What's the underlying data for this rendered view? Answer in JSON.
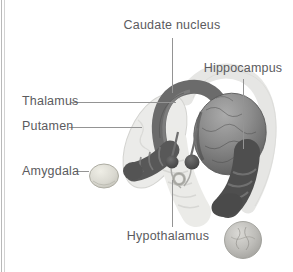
{
  "figure": {
    "type": "brain-anatomy-diagram",
    "labels": {
      "caudate_nucleus": "Caudate nucleus",
      "hippocampus": "Hippocampus",
      "thalamus": "Thalamus",
      "putamen": "Putamen",
      "amygdala": "Amygdala",
      "hypothalamus": "Hypothalamus"
    },
    "colors": {
      "background": "#ffffff",
      "label_text": "#5b5b5e",
      "leader_line": "#949494",
      "dark_structure": "#4e4e4e",
      "mid_structure": "#8a8a8a",
      "light_structure": "#e6e6e4",
      "page_edge_line": "#b9b9b9"
    }
  }
}
